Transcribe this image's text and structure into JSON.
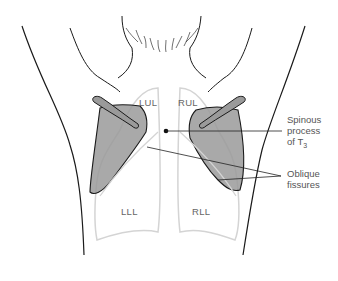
{
  "diagram": {
    "lobes": {
      "lul": "LUL",
      "rul": "RUL",
      "lll": "LLL",
      "rll": "RLL"
    },
    "callouts": {
      "spinous_line1": "Spinous",
      "spinous_line2": "process",
      "spinous_line3_prefix": "of T",
      "spinous_sub": "3",
      "oblique_line1": "Oblique",
      "oblique_line2": "fissures"
    },
    "colors": {
      "outline": "#1a1a1a",
      "lung_outline": "#d4d4d4",
      "scapula_fill": "#9a9a9a",
      "text": "#555555"
    }
  }
}
